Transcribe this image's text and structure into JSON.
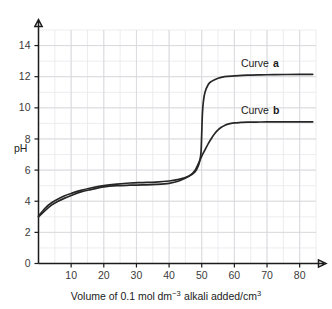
{
  "chart_data": {
    "type": "line",
    "title": "",
    "xlabel": "Volume of 0.1 mol dm−3 alkali added/cm3",
    "xlabel_parts": {
      "lead": "Volume of 0.1",
      "unit_mol": "mol",
      "unit_dm": "dm",
      "unit_dm_exp": "−3",
      "mid": "alkali added/cm",
      "cm_exp": "3"
    },
    "ylabel": "pH",
    "xlim": [
      0,
      85
    ],
    "ylim": [
      0,
      15
    ],
    "xticks": [
      10,
      20,
      30,
      40,
      50,
      60,
      70,
      80
    ],
    "yticks": [
      0,
      2,
      4,
      6,
      8,
      10,
      12,
      14
    ],
    "xtick_labels": [
      "10",
      "20",
      "30",
      "40",
      "50",
      "60",
      "70",
      "80"
    ],
    "ytick_labels": [
      "0",
      "2",
      "4",
      "6",
      "8",
      "10",
      "12",
      "14"
    ],
    "grid": true,
    "grid_minor_step_x": 5,
    "grid_minor_step_y": 1,
    "legend_position": "inline-above-curve",
    "equivalence_volume": 50,
    "series": [
      {
        "name": "Curve a",
        "label_text": "Curve",
        "label_id": "a",
        "color": "#262626",
        "start_ph": 3.05,
        "buffer_ph": 5.2,
        "final_ph": 12.15,
        "x": [
          0,
          2,
          4,
          6,
          8,
          10,
          13,
          16,
          20,
          24,
          28,
          32,
          36,
          40,
          43,
          46,
          48,
          49,
          49.5,
          49.8,
          50,
          50.2,
          50.5,
          51,
          52,
          53,
          55,
          57,
          60,
          64,
          68,
          72,
          76,
          80,
          84
        ],
        "y": [
          3.05,
          3.55,
          3.9,
          4.15,
          4.35,
          4.5,
          4.7,
          4.85,
          5.0,
          5.1,
          5.17,
          5.2,
          5.23,
          5.3,
          5.4,
          5.6,
          5.9,
          6.3,
          6.7,
          7.2,
          8.4,
          9.6,
          10.4,
          11.0,
          11.5,
          11.7,
          11.9,
          12.0,
          12.05,
          12.1,
          12.12,
          12.13,
          12.14,
          12.15,
          12.15
        ]
      },
      {
        "name": "Curve b",
        "label_text": "Curve",
        "label_id": "b",
        "color": "#262626",
        "start_ph": 3.0,
        "buffer_ph": 5.05,
        "final_ph": 9.1,
        "x": [
          0,
          2,
          4,
          6,
          8,
          10,
          13,
          16,
          20,
          24,
          28,
          32,
          36,
          40,
          43,
          46,
          48,
          50,
          51,
          52,
          53,
          54,
          55,
          56,
          57,
          58,
          60,
          62,
          64,
          68,
          72,
          76,
          80,
          84
        ],
        "y": [
          3.0,
          3.4,
          3.75,
          4.0,
          4.2,
          4.37,
          4.6,
          4.75,
          4.92,
          5.0,
          5.03,
          5.05,
          5.08,
          5.15,
          5.3,
          5.6,
          6.0,
          6.9,
          7.3,
          7.7,
          8.05,
          8.35,
          8.58,
          8.75,
          8.87,
          8.95,
          9.03,
          9.06,
          9.08,
          9.09,
          9.1,
          9.1,
          9.1,
          9.1
        ]
      }
    ],
    "annotations": [
      {
        "text": "Curve a",
        "at_x": 62,
        "at_y": 12.6
      },
      {
        "text": "Curve b",
        "at_x": 62,
        "at_y": 9.6
      }
    ]
  }
}
